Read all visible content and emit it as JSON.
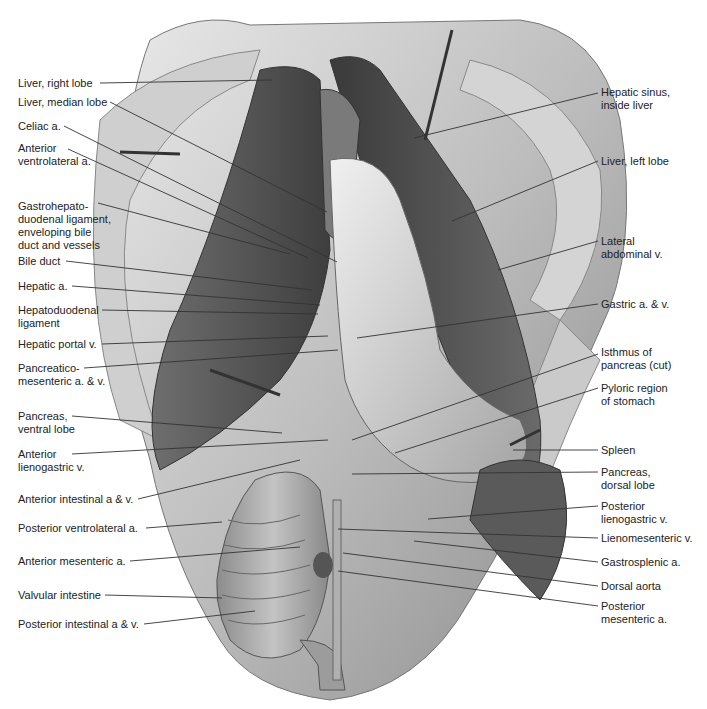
{
  "figure": {
    "type": "anatomical illustration",
    "labels_left": [
      {
        "id": "liver-right-lobe",
        "text": "Liver, right lobe",
        "x": 18,
        "y": 77,
        "lx1": 100,
        "ly1": 83,
        "lx2": 272,
        "ly2": 80
      },
      {
        "id": "liver-median-lobe",
        "text": "Liver, median lobe",
        "x": 18,
        "y": 96,
        "lx1": 110,
        "ly1": 102,
        "lx2": 327,
        "ly2": 212
      },
      {
        "id": "celiac-a",
        "text": "Celiac a.",
        "x": 18,
        "y": 120,
        "lx1": 64,
        "ly1": 126,
        "lx2": 337,
        "ly2": 262
      },
      {
        "id": "anterior-ventrolateral-a",
        "text": "Anterior\nventrolateral a.",
        "x": 18,
        "y": 142,
        "lx1": 68,
        "ly1": 149,
        "lx2": 308,
        "ly2": 258
      },
      {
        "id": "gastrohepatoduodenal-ligament",
        "text": "Gastrohepato-\nduodenal ligament,\nenveloping bile\nduct and vessels",
        "x": 18,
        "y": 200,
        "lx1": 98,
        "ly1": 203,
        "lx2": 290,
        "ly2": 254
      },
      {
        "id": "bile-duct",
        "text": "Bile duct",
        "x": 18,
        "y": 255,
        "lx1": 66,
        "ly1": 261,
        "lx2": 312,
        "ly2": 290
      },
      {
        "id": "hepatic-a",
        "text": "Hepatic a.",
        "x": 18,
        "y": 280,
        "lx1": 72,
        "ly1": 286,
        "lx2": 320,
        "ly2": 305
      },
      {
        "id": "hepatoduodenal-ligament",
        "text": "Hepatoduodenal\nligament",
        "x": 18,
        "y": 304,
        "lx1": 102,
        "ly1": 310,
        "lx2": 318,
        "ly2": 314
      },
      {
        "id": "hepatic-portal-v",
        "text": "Hepatic portal v.",
        "x": 18,
        "y": 338,
        "lx1": 102,
        "ly1": 344,
        "lx2": 328,
        "ly2": 336
      },
      {
        "id": "pancreaticomesenteric-av",
        "text": "Pancreatico-\nmesenteric a. & v.",
        "x": 18,
        "y": 362,
        "lx1": 84,
        "ly1": 368,
        "lx2": 338,
        "ly2": 350
      },
      {
        "id": "pancreas-ventral-lobe",
        "text": "Pancreas,\nventral lobe",
        "x": 18,
        "y": 410,
        "lx1": 72,
        "ly1": 416,
        "lx2": 282,
        "ly2": 433
      },
      {
        "id": "anterior-lienogastric-v",
        "text": "Anterior\nlienogastric v.",
        "x": 18,
        "y": 448,
        "lx1": 72,
        "ly1": 454,
        "lx2": 328,
        "ly2": 440
      },
      {
        "id": "anterior-intestinal-av",
        "text": "Anterior intestinal a & v.",
        "x": 18,
        "y": 493,
        "lx1": 138,
        "ly1": 499,
        "lx2": 300,
        "ly2": 460
      },
      {
        "id": "posterior-ventrolateral-a",
        "text": "Posterior ventrolateral a.",
        "x": 18,
        "y": 522,
        "lx1": 146,
        "ly1": 528,
        "lx2": 222,
        "ly2": 522
      },
      {
        "id": "anterior-mesenteric-a",
        "text": "Anterior mesenteric a.",
        "x": 18,
        "y": 555,
        "lx1": 130,
        "ly1": 561,
        "lx2": 300,
        "ly2": 547
      },
      {
        "id": "valvular-intestine",
        "text": "Valvular intestine",
        "x": 18,
        "y": 589,
        "lx1": 105,
        "ly1": 595,
        "lx2": 222,
        "ly2": 598
      },
      {
        "id": "posterior-intestinal-av",
        "text": "Posterior intestinal a & v.",
        "x": 18,
        "y": 618,
        "lx1": 144,
        "ly1": 624,
        "lx2": 255,
        "ly2": 611
      }
    ],
    "labels_right": [
      {
        "id": "hepatic-sinus",
        "text": "Hepatic sinus,\ninside liver",
        "x": 601,
        "y": 86,
        "lx1": 598,
        "ly1": 93,
        "lx2": 414,
        "ly2": 138
      },
      {
        "id": "liver-left-lobe",
        "text": "Liver, left lobe",
        "x": 601,
        "y": 155,
        "lx1": 598,
        "ly1": 161,
        "lx2": 452,
        "ly2": 221
      },
      {
        "id": "lateral-abdominal-v",
        "text": "Lateral\nabdominal v.",
        "x": 601,
        "y": 235,
        "lx1": 598,
        "ly1": 241,
        "lx2": 498,
        "ly2": 270
      },
      {
        "id": "gastric-av",
        "text": "Gastric a. & v.",
        "x": 601,
        "y": 298,
        "lx1": 598,
        "ly1": 304,
        "lx2": 357,
        "ly2": 338
      },
      {
        "id": "isthmus-of-pancreas",
        "text": "Isthmus of\npancreas (cut)",
        "x": 601,
        "y": 346,
        "lx1": 598,
        "ly1": 354,
        "lx2": 352,
        "ly2": 440
      },
      {
        "id": "pyloric-region",
        "text": "Pyloric region\nof stomach",
        "x": 601,
        "y": 382,
        "lx1": 598,
        "ly1": 388,
        "lx2": 395,
        "ly2": 453
      },
      {
        "id": "spleen",
        "text": "Spleen",
        "x": 601,
        "y": 444,
        "lx1": 598,
        "ly1": 450,
        "lx2": 513,
        "ly2": 450
      },
      {
        "id": "pancreas-dorsal-lobe",
        "text": "Pancreas,\ndorsal lobe",
        "x": 601,
        "y": 466,
        "lx1": 598,
        "ly1": 472,
        "lx2": 352,
        "ly2": 474
      },
      {
        "id": "posterior-lienogastric-v",
        "text": "Posterior\nlienogastric v.",
        "x": 601,
        "y": 500,
        "lx1": 598,
        "ly1": 506,
        "lx2": 428,
        "ly2": 519
      },
      {
        "id": "lienomesenteric-v",
        "text": "Lienomesenteric v.",
        "x": 601,
        "y": 532,
        "lx1": 598,
        "ly1": 538,
        "lx2": 338,
        "ly2": 529
      },
      {
        "id": "gastrosplenic-a",
        "text": "Gastrosplenic a.",
        "x": 601,
        "y": 556,
        "lx1": 598,
        "ly1": 562,
        "lx2": 414,
        "ly2": 541
      },
      {
        "id": "dorsal-aorta",
        "text": "Dorsal aorta",
        "x": 601,
        "y": 580,
        "lx1": 598,
        "ly1": 586,
        "lx2": 343,
        "ly2": 553
      },
      {
        "id": "posterior-mesenteric-a",
        "text": "Posterior\nmesenteric a.",
        "x": 601,
        "y": 600,
        "lx1": 598,
        "ly1": 606,
        "lx2": 338,
        "ly2": 571
      }
    ],
    "colors": {
      "label_text": "#222222",
      "leader_line": "#333333",
      "tissue_light": "#d8d8d8",
      "tissue_mid": "#9a9a9a",
      "tissue_dark": "#555555",
      "background": "#ffffff"
    }
  }
}
